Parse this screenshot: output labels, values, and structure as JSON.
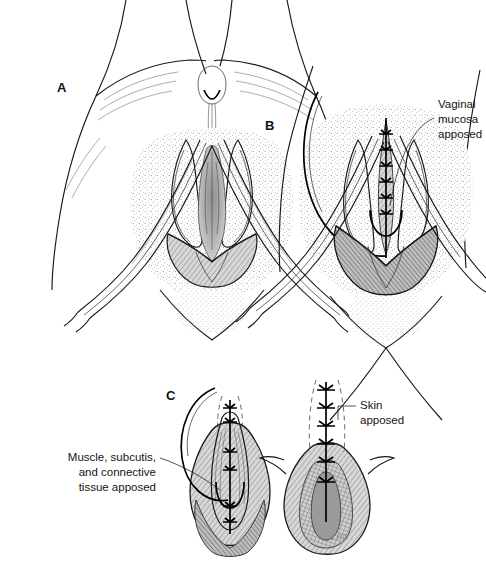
{
  "figure": {
    "background_color": "#ffffff",
    "ink_color": "#1b1b1b",
    "width": 486,
    "height": 577
  },
  "panels": [
    {
      "letter": "A",
      "name": "panel-a",
      "description": "Perineum with episiotomy incision open, labia retracted",
      "letter_x": 57,
      "letter_y": 92
    },
    {
      "letter": "B",
      "name": "panel-b",
      "description": "Vaginal mucosa closed with continuous suture",
      "letter_x": 265,
      "letter_y": 130
    },
    {
      "letter": "C",
      "name": "panel-c",
      "description": "Deep layers and skin closure, two views",
      "letter_x": 166,
      "letter_y": 400
    }
  ],
  "callouts": [
    {
      "name": "callout-vaginal-mucosa",
      "lines": [
        "Vaginal",
        "mucosa",
        "apposed"
      ],
      "text_x": 438,
      "text_y": 108,
      "line_height": 15,
      "anchor": "start"
    },
    {
      "name": "callout-muscle-subcutis",
      "lines": [
        "Muscle, subcutis,",
        "and connective",
        "tissue apposed"
      ],
      "text_x": 156,
      "text_y": 461,
      "line_height": 15,
      "anchor": "end"
    },
    {
      "name": "callout-skin-apposed",
      "lines": [
        "Skin",
        "apposed"
      ],
      "text_x": 360,
      "text_y": 409,
      "line_height": 15,
      "anchor": "start"
    }
  ],
  "signature": {
    "name": "artist-signature",
    "text": "LPD",
    "x": 332,
    "y": 540
  }
}
